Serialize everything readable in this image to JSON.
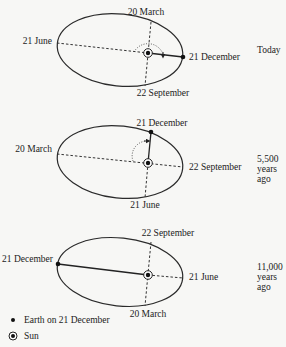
{
  "panels": [
    {
      "time_label": [
        "Today"
      ],
      "labels": {
        "top": "20 March",
        "left": "21 June",
        "right": "21 December",
        "bottom": "22 September"
      }
    },
    {
      "time_label": [
        "5,500",
        "years",
        "ago"
      ],
      "labels": {
        "top": "21 December",
        "left": "20 March",
        "right": "22 September",
        "bottom": "21 June"
      }
    },
    {
      "time_label": [
        "11,000",
        "years",
        "ago"
      ],
      "labels": {
        "top": "22 September",
        "left": "21 December",
        "right": "21 June",
        "bottom": "20 March"
      }
    }
  ],
  "legend": {
    "earth": "Earth on 21 December",
    "sun": "Sun"
  },
  "icons": {
    "earth": "filled-dot-icon",
    "sun": "circled-dot-icon"
  }
}
